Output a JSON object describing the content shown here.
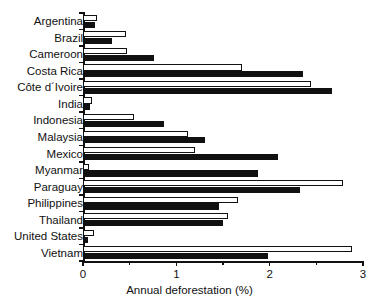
{
  "chart_data": {
    "type": "bar",
    "orientation": "horizontal",
    "title": "",
    "xlabel": "Annual deforestation (%)",
    "ylabel": "",
    "xlim": [
      0,
      3
    ],
    "xticks": [
      0,
      1,
      2,
      3
    ],
    "xtick_labels": [
      "0",
      "1",
      "2",
      "3"
    ],
    "minor_xticks": [
      0.5,
      1.5,
      2.5
    ],
    "grid": false,
    "legend": null,
    "categories": [
      "Argentina",
      "Brazil",
      "Cameroon",
      "Costa Rica",
      "Côte d´Ivoire",
      "India",
      "Indonesia",
      "Malaysia",
      "Mexico",
      "Myanmar",
      "Paraguay",
      "Philippines",
      "Thailand",
      "United States",
      "Vietnam"
    ],
    "series": [
      {
        "name": "open",
        "style": "open",
        "color": "#ffffff",
        "edge_color": "#111111",
        "values": [
          0.15,
          0.46,
          0.47,
          1.7,
          2.44,
          0.1,
          0.55,
          1.13,
          1.2,
          0.06,
          2.79,
          1.66,
          1.55,
          0.12,
          2.88
        ]
      },
      {
        "name": "filled",
        "style": "filled",
        "color": "#111111",
        "edge_color": "#111111",
        "values": [
          0.13,
          0.31,
          0.76,
          2.36,
          2.67,
          0.07,
          0.87,
          1.31,
          2.09,
          1.88,
          2.32,
          1.46,
          1.5,
          0.05,
          1.98
        ]
      }
    ]
  },
  "axis": {
    "x_title": "Annual deforestation (%)"
  }
}
